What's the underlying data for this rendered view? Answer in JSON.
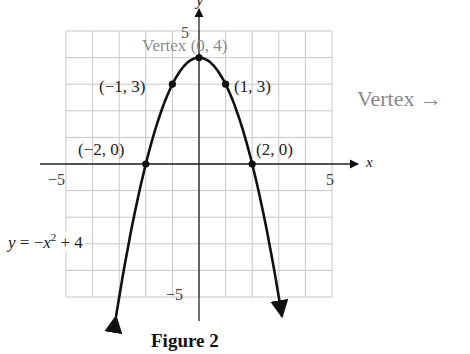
{
  "chart_data": {
    "type": "line",
    "title": "Figure 2",
    "equation": "y = −x² + 4",
    "xlabel": "x",
    "ylabel": "y",
    "xlim": [
      -5,
      5
    ],
    "ylim": [
      -5,
      5
    ],
    "grid": true,
    "x_ticks": [
      "−5",
      "5"
    ],
    "y_ticks": [
      "5",
      "−5"
    ],
    "series": [
      {
        "name": "y = −x² + 4",
        "function": "-x^2 + 4",
        "x": [
          -3,
          -2,
          -1,
          0,
          1,
          2,
          3
        ],
        "y": [
          -5,
          0,
          3,
          4,
          3,
          0,
          -5
        ]
      }
    ],
    "points": [
      {
        "label": "(−2, 0)",
        "x": -2,
        "y": 0
      },
      {
        "label": "(−1, 3)",
        "x": -1,
        "y": 3
      },
      {
        "label": "(0, 4)",
        "x": 0,
        "y": 4
      },
      {
        "label": "(1, 3)",
        "x": 1,
        "y": 3
      },
      {
        "label": "(2, 0)",
        "x": 2,
        "y": 0
      }
    ],
    "annotations": [
      "Vertex (0, 4)",
      "Vertex →"
    ]
  },
  "labels": {
    "vertex_inline": "Vertex",
    "vertex_point": "(0, 4)",
    "vertex_arrow": "Vertex →",
    "pt_m1": "(−1, 3)",
    "pt_p1": "(1, 3)",
    "pt_m2": "(−2, 0)",
    "pt_p2": "(2, 0)",
    "tick_x_neg": "−5",
    "tick_x_pos": "5",
    "tick_y_pos": "5",
    "tick_y_neg": "−5",
    "axis_x": "x",
    "axis_y": "y",
    "eq_y": "y",
    "eq_rest1": " = −",
    "eq_x": "x",
    "eq_sup": "2",
    "eq_rest2": " + 4",
    "figure_title": "Figure 2"
  }
}
